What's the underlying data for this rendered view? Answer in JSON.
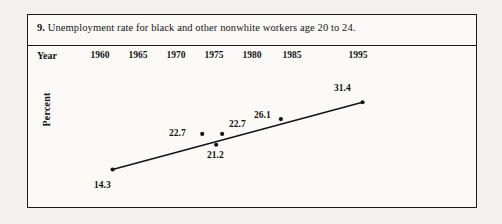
{
  "figure": {
    "number": "9.",
    "caption": "Unemployment rate for black and other nonwhite workers age 20 to 24."
  },
  "axes": {
    "x_axis_name": "Year",
    "y_axis_name": "Percent"
  },
  "colors": {
    "ink": "#141414",
    "frame": "#1a1a1a",
    "paper": "#fbfaf7",
    "page": "#f2f1ee"
  },
  "chart_data": {
    "type": "line",
    "title": "Unemployment rate for black and other nonwhite workers age 20 to 24.",
    "xlabel": "Year",
    "ylabel": "Percent",
    "grid": false,
    "legend": "none",
    "xlim": [
      1958,
      1997
    ],
    "ylim": [
      12,
      33
    ],
    "xticks": [
      "1960",
      "1965",
      "1970",
      "1975",
      "1980",
      "1985",
      "1995"
    ],
    "x": [
      1960,
      1974,
      1976,
      1977,
      1981,
      1995
    ],
    "values": [
      14.3,
      22.7,
      21.2,
      22.7,
      26.1,
      31.4
    ],
    "point_labels": [
      "14.3",
      "22.7",
      "21.2",
      "22.7",
      "26.1",
      "31.4"
    ]
  },
  "xtick_positions_px": [
    72,
    110,
    148,
    186,
    224,
    264,
    330
  ],
  "points_px": [
    {
      "label": "14.3",
      "cx": 85,
      "cy": 125,
      "lx": 66,
      "ly": 134,
      "on_line": true
    },
    {
      "label": "22.7",
      "cx": 175,
      "cy": 89,
      "lx": 141,
      "ly": 82,
      "on_line": false
    },
    {
      "label": "21.2",
      "cx": 189,
      "cy": 100,
      "lx": 179,
      "ly": 104,
      "on_line": false
    },
    {
      "label": "22.7",
      "cx": 195,
      "cy": 89,
      "lx": 201,
      "ly": 73,
      "on_line": true
    },
    {
      "label": "26.1",
      "cx": 254,
      "cy": 74,
      "lx": 226,
      "ly": 64,
      "on_line": true
    },
    {
      "label": "31.4",
      "cx": 336,
      "cy": 57,
      "lx": 306,
      "ly": 37,
      "on_line": true
    }
  ],
  "line_segment_px": {
    "x1": 85,
    "y1": 125,
    "x2": 336,
    "y2": 57
  }
}
